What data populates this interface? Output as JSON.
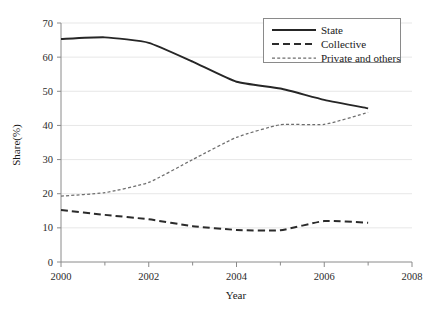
{
  "chart_data": {
    "type": "line",
    "title": "",
    "xlabel": "Year",
    "ylabel": "Share(%)",
    "x": [
      2000,
      2001,
      2002,
      2003,
      2004,
      2005,
      2006,
      2007
    ],
    "xlim": [
      2000,
      2008
    ],
    "ylim": [
      0,
      70
    ],
    "grid": true,
    "legend_position": "top-right",
    "x_ticks_major": [
      "2000",
      "2002",
      "2004",
      "2006",
      "2008"
    ],
    "x_ticks_minor": [
      "2001",
      "2003",
      "2005",
      "2007"
    ],
    "y_ticks": [
      "0",
      "10",
      "20",
      "30",
      "40",
      "50",
      "60",
      "70"
    ],
    "series": [
      {
        "name": "State",
        "style": "solid",
        "color": "#262626",
        "values": [
          65.3,
          65.8,
          64.2,
          58.7,
          52.8,
          50.8,
          47.5,
          45.0
        ]
      },
      {
        "name": "Collective",
        "style": "dashed",
        "color": "#2b2b2b",
        "values": [
          15.2,
          13.8,
          12.5,
          10.5,
          9.4,
          9.3,
          12.0,
          11.5
        ]
      },
      {
        "name": "Private and others",
        "style": "fine-dashed",
        "color": "#6e6e6e",
        "values": [
          19.3,
          20.3,
          23.3,
          30.0,
          36.5,
          40.2,
          40.3,
          43.8
        ]
      }
    ]
  },
  "legend": {
    "items": [
      {
        "label": "State"
      },
      {
        "label": "Collective"
      },
      {
        "label": "Private and others"
      }
    ]
  },
  "axes": {
    "y_title": "Share(%)",
    "x_title": "Year",
    "y_tick_labels": [
      "70",
      "60",
      "50",
      "40",
      "30",
      "20",
      "10",
      "0"
    ],
    "x_tick_labels": [
      "2000",
      "2002",
      "2004",
      "2006",
      "2008"
    ]
  },
  "colors": {
    "background": "#ffffff",
    "grid": "#e4e4e4",
    "axis": "#8a8a8a",
    "text": "#1a1a1a",
    "state_line": "#262626",
    "collective_line": "#2b2b2b",
    "private_line": "#6e6e6e"
  }
}
